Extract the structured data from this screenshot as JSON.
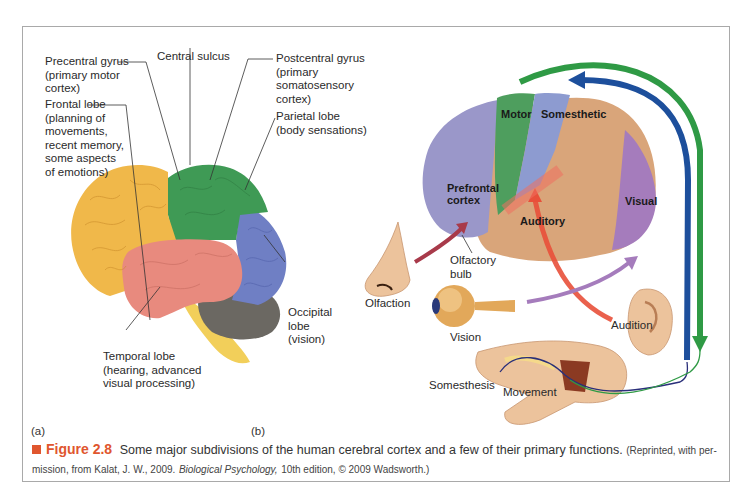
{
  "figure": {
    "panel_a_tag": "(a)",
    "panel_b_tag": "(b)",
    "caption": {
      "number": "Figure 2.8",
      "text": "Some major subdivisions of the human cerebral cortex and a few of their primary functions.",
      "source_prefix": "(Reprinted, with per-mission, from Kalat, J. W., 2009.",
      "source_book": "Biological Psychology,",
      "source_suffix": "10th edition, © 2009 Wadsworth.)",
      "accent_color": "#e0562e"
    }
  },
  "panel_a": {
    "labels": {
      "precentral": "Precentral gyrus\n(primary motor\ncortex)",
      "central_sulcus": "Central sulcus",
      "postcentral": "Postcentral gyrus\n(primary\nsomatosensory\ncortex)",
      "frontal": "Frontal lobe\n(planning of\nmovements,\nrecent memory,\nsome aspects\nof emotions)",
      "parietal": "Parietal lobe\n(body sensations)",
      "occipital": "Occipital\nlobe\n(vision)",
      "temporal": "Temporal lobe\n(hearing, advanced\nvisual processing)"
    },
    "colors": {
      "frontal": "#f0b84a",
      "parietal": "#3f9a55",
      "occipital": "#6f7fc4",
      "temporal": "#e88a7e",
      "cerebellum": "#6b6862",
      "brainstem": "#f2cf5a"
    }
  },
  "panel_b": {
    "labels": {
      "motor": "Motor",
      "somesthetic": "Somesthetic",
      "prefrontal": "Prefrontal\ncortex",
      "auditory": "Auditory",
      "visual": "Visual",
      "olfactory_bulb": "Olfactory\nbulb",
      "olfaction": "Olfaction",
      "vision": "Vision",
      "audition": "Audition",
      "somesthesis": "Somesthesis",
      "movement": "Movement"
    },
    "colors": {
      "prefrontal": "#9a97c9",
      "motor": "#4e9e5e",
      "somesthetic": "#8d9bd0",
      "association": "#d9a57a",
      "visual": "#a57cbc",
      "auditory_arrow": "#e8503a",
      "blue_arrow": "#1d4f9c",
      "green_arrow": "#2f9a45"
    }
  }
}
